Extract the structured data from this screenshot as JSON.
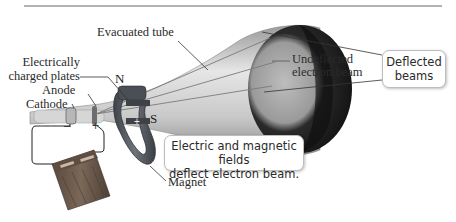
{
  "diagram": {
    "labels": {
      "evacuated_tube": "Evacuated tube",
      "charged_plates_line1": "Electrically",
      "charged_plates_line2": "charged plates",
      "anode": "Anode",
      "cathode": "Cathode",
      "undeflected_line1": "Undeflected",
      "undeflected_line2": "electron beam",
      "magnet": "Magnet",
      "north_pole": "N",
      "south_pole": "S",
      "battery_negative": "–",
      "battery_positive": "+",
      "plate_negative": "–",
      "plate_positive": "+"
    },
    "callouts": {
      "deflected_line1": "Deflected",
      "deflected_line2": "beams",
      "fields_line1": "Electric and magnetic fields",
      "fields_line2": "deflect electron beam."
    },
    "colors": {
      "tube_light": "#d9d9d9",
      "tube_dark": "#8a8a8a",
      "screen_dark": "#1e1e1e",
      "magnet": "#5a5f66",
      "battery": "#6b5a4c",
      "leader_line": "#333333",
      "rule_line": "#666666"
    }
  }
}
